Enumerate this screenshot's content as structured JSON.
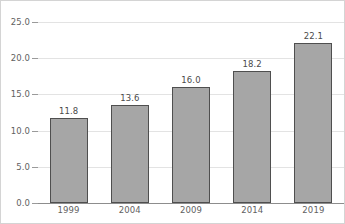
{
  "chart_data": {
    "type": "bar",
    "title": "",
    "subtitle": "",
    "xlabel": "",
    "ylabel": "",
    "categories": [
      "1999",
      "2004",
      "2009",
      "2014",
      "2019"
    ],
    "values": [
      11.8,
      13.6,
      16.0,
      18.2,
      22.1
    ],
    "value_labels": [
      "11.8",
      "13.6",
      "16.0",
      "18.2",
      "22.1"
    ],
    "ylim": [
      0.0,
      25.0
    ],
    "ytick_values": [
      0.0,
      5.0,
      10.0,
      15.0,
      20.0,
      25.0
    ],
    "ytick_labels": [
      "0.0",
      "5.0",
      "10.0",
      "15.0",
      "20.0",
      "25.0"
    ],
    "grid": true,
    "grid_axis": "y",
    "legend": false,
    "legend_position": "none",
    "annotations": [
      "Data labels shown above each bar"
    ],
    "colors": {
      "bar_fill": "#a6a6a6",
      "bar_edge": "#4f4f4f",
      "gridline": "#e3e3e3",
      "axis": "#8d8d8d",
      "tick_label": "#5f5f5f",
      "value_label": "#4a4a4a",
      "background": "#ffffff",
      "frame": "#d4d4d4"
    }
  }
}
